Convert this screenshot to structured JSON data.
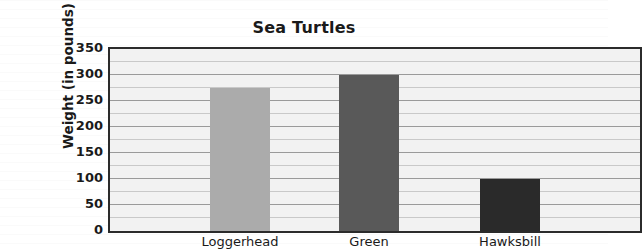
{
  "chart_data": {
    "type": "bar",
    "title": "Sea Turtles",
    "xlabel": "",
    "ylabel": "Weight (in pounds)",
    "categories": [
      "Loggerhead",
      "Green",
      "Hawksbill"
    ],
    "values": [
      275,
      300,
      100
    ],
    "ylim": [
      0,
      350
    ],
    "ytick_step": 50,
    "yticks": [
      350,
      300,
      250,
      200,
      150,
      100,
      50,
      0
    ],
    "ytick_labels": [
      "350",
      "300",
      "250",
      "200",
      "150",
      "100",
      "50",
      "0"
    ],
    "grid": true,
    "minor_grid": true,
    "minor_grid_step": 25,
    "legend": null,
    "legend_position": "none",
    "bar_colors": [
      "#ababab",
      "#595959",
      "#2a2a2a"
    ],
    "plot_background": "#f2f2f2",
    "axis_color": "#2b2b2b",
    "gridline_color": "#9a9a9a",
    "minor_gridline_color": "#c9c9c9"
  }
}
